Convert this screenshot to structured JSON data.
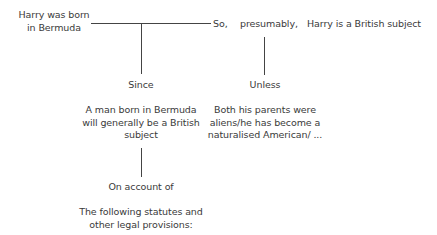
{
  "diagram": {
    "type": "Toulmin argument model",
    "datum": {
      "lines": [
        "Harry was born",
        "in Bermuda"
      ]
    },
    "so_label": "So,",
    "qualifier": "presumably,",
    "claim": "Harry is a British subject",
    "since_label": "Since",
    "warrant": {
      "lines": [
        "A man born in Bermuda",
        "will generally be a British",
        "subject"
      ]
    },
    "unless_label": "Unless",
    "rebuttal": {
      "lines": [
        "Both his parents were",
        "aliens/he has become a",
        "naturalised American/ ..."
      ]
    },
    "on_account_of_label": "On account of",
    "backing": {
      "lines": [
        "The following statutes and",
        "other legal provisions:"
      ]
    }
  },
  "colors": {
    "text": "#3a3a3a",
    "line": "#444444",
    "background": "#ffffff"
  }
}
